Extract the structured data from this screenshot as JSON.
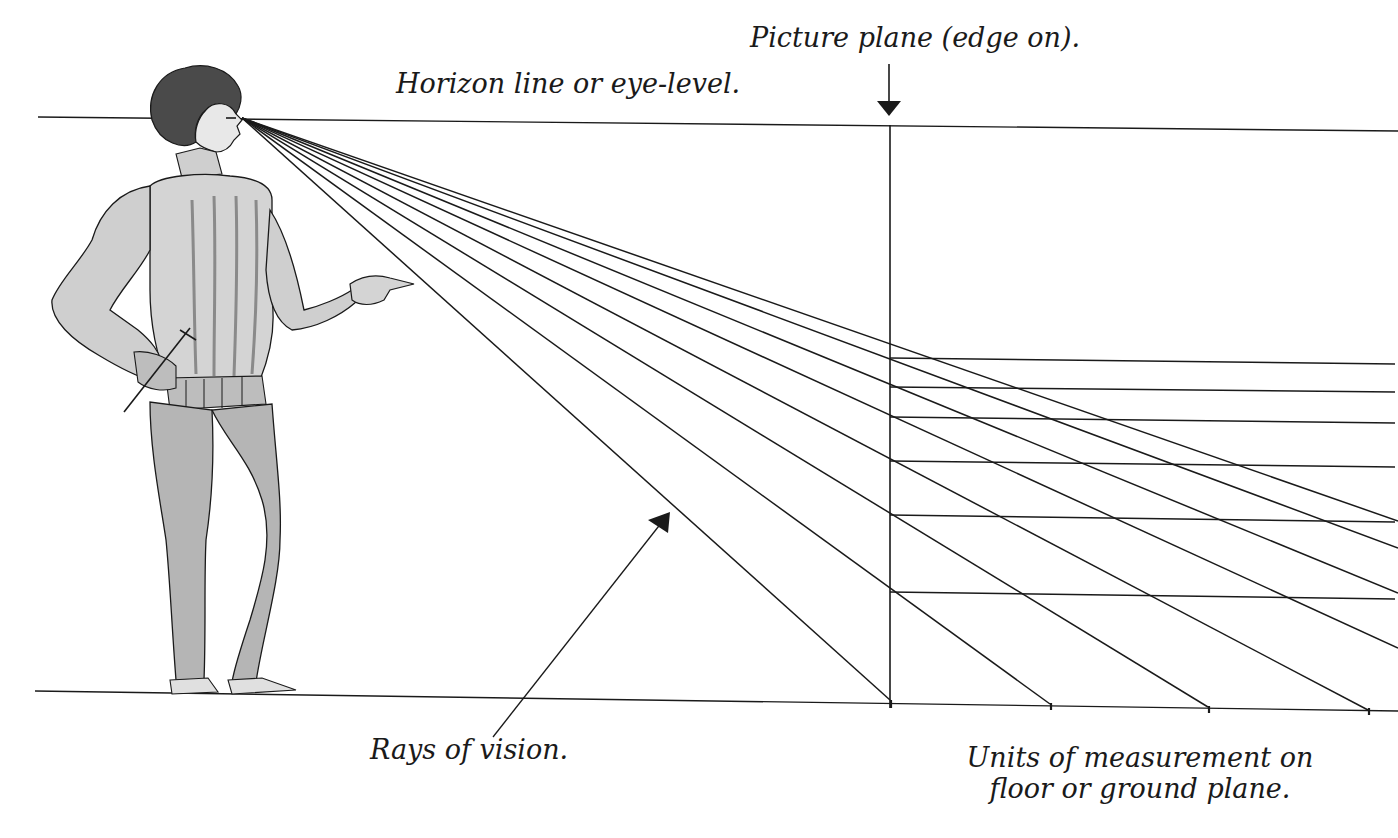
{
  "diagram": {
    "labels": {
      "picture_plane": "Picture plane (edge on).",
      "horizon": "Horizon line or eye-level.",
      "rays": "Rays of vision.",
      "units_line1": "Units of measurement on",
      "units_line2": "floor or ground plane."
    },
    "colors": {
      "ink": "#1a1a1a",
      "shade": "#8a8a8a",
      "light_shade": "#c8c8c8",
      "paper": "#ffffff"
    },
    "geometry": {
      "eye": [
        242,
        118
      ],
      "horizon_line": {
        "from": [
          38,
          117
        ],
        "to": [
          1398,
          131
        ]
      },
      "ground_line": {
        "from": [
          35,
          691
        ],
        "to": [
          1398,
          711
        ]
      },
      "picture_plane": {
        "x": 890,
        "top": 125,
        "bottom": 706
      },
      "ground_points_x": [
        890,
        1050,
        1208,
        1368
      ],
      "picture_plane_marks_y": [
        358,
        387,
        417,
        461,
        515,
        592
      ]
    },
    "figure": {
      "description": "Renaissance man in doublet and hose, pointing right, eye on horizon line"
    }
  }
}
